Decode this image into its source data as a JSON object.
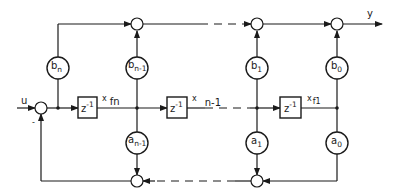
{
  "diagram": {
    "type": "block-diagram",
    "title": "",
    "input_label": "u",
    "output_label": "y",
    "input_sign": "-",
    "colors": {
      "ink": "#1a1a1a",
      "background": "#ffffff"
    },
    "delays": [
      {
        "label": "z",
        "exp": "-1",
        "state_x": "x",
        "state_sub": "fn"
      },
      {
        "label": "z",
        "exp": "-1",
        "state_x": "x",
        "state_sub": "n-1"
      },
      {
        "label": "z",
        "exp": "-1",
        "state_x": "x",
        "state_sub": "f1"
      }
    ],
    "feedforward_gains": [
      {
        "base": "b",
        "sub": "n"
      },
      {
        "base": "b",
        "sub": "n-1"
      },
      {
        "base": "b",
        "sub": "1"
      },
      {
        "base": "b",
        "sub": "0"
      }
    ],
    "feedback_gains": [
      {
        "base": "a",
        "sub": "n-1"
      },
      {
        "base": "a",
        "sub": "1"
      },
      {
        "base": "a",
        "sub": "0"
      }
    ]
  }
}
